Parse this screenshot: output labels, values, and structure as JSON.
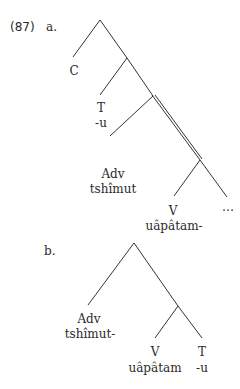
{
  "example": {
    "number": "(87)",
    "a": {
      "label": "a.",
      "nodes": {
        "c": "C",
        "t": "T",
        "t_morph": "-u",
        "adv": "Adv",
        "adv_morph": "tshîmut",
        "v": "V",
        "v_morph": "uâpâtam-",
        "ellipsis": "…"
      }
    },
    "b": {
      "label": "b.",
      "nodes": {
        "adv": "Adv",
        "adv_morph": "tshîmut-",
        "v": "V",
        "v_morph": "uâpâtam",
        "t": "T",
        "t_morph": "-u"
      }
    }
  }
}
